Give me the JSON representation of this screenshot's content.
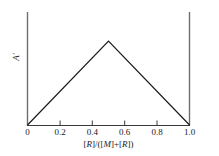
{
  "chart_data": {
    "type": "line",
    "title": "",
    "subtitle": "",
    "xlabel": "[R]/([M]+[R])",
    "ylabel": "A'",
    "xlim": [
      0.0,
      1.0
    ],
    "ylim": [
      0.0,
      1.0
    ],
    "grid": false,
    "legend": null,
    "annotations": [],
    "x_ticks": [
      0.0,
      0.2,
      0.4,
      0.6,
      0.8,
      1.0
    ],
    "x_tick_labels": [
      "0",
      "0.2",
      "0.4",
      "0.6",
      "0.8",
      "1.0"
    ],
    "y_ticks": [],
    "y_tick_labels": [],
    "series": [
      {
        "name": "Job plot",
        "x": [
          0.0,
          0.5,
          1.0
        ],
        "values": [
          0.0,
          1.0,
          0.0
        ],
        "color": "#1a1a1a",
        "line_width": 1.2,
        "marker": "none"
      }
    ]
  },
  "axis": {
    "x_label_parts": {
      "p1": "[",
      "p2": "R",
      "p3": "]/([",
      "p4": "M",
      "p5": "]+[",
      "p6": "R",
      "p7": "])"
    },
    "y_label_text": "A",
    "y_label_prime": "′",
    "left_spine": true,
    "right_spine": true,
    "bottom_spine": true,
    "top_spine": false,
    "tick_direction": "in"
  },
  "style": {
    "background": "#ffffff",
    "axis_color": "#6e6e6e",
    "bottom_axis_color": "#3a3a3a",
    "data_color": "#1a1a1a",
    "text_color": "#1a1a1a"
  }
}
